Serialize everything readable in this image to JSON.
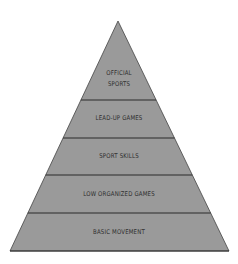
{
  "diagram": {
    "type": "pyramid",
    "fill_color": "#9a9a9a",
    "stroke_color": "#333333",
    "background": "#ffffff",
    "levels_top_to_bottom": [
      {
        "label_line1": "OFFICIAL",
        "label_line2": "SPORTS"
      },
      {
        "label_line1": "LEAD-UP GAMES"
      },
      {
        "label_line1": "SPORT SKILLS"
      },
      {
        "label_line1": "LOW ORGANIZED GAMES"
      },
      {
        "label_line1": "BASIC MOVEMENT"
      }
    ]
  }
}
